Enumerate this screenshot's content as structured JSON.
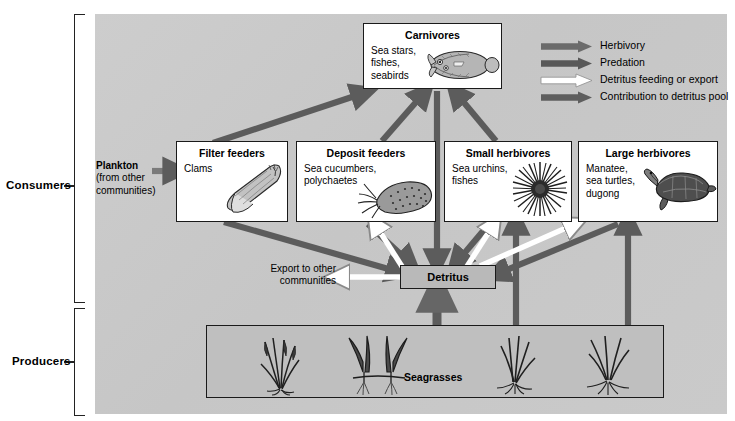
{
  "diagram": {
    "background_color": "#c9c9c9",
    "arrow_dark_color": "#595959",
    "arrow_white_color": "#ffffff"
  },
  "side_labels": [
    {
      "name": "consumers",
      "label": "Consumers"
    },
    {
      "name": "producers",
      "label": "Producers"
    }
  ],
  "legend": {
    "items": [
      {
        "label": "Herbivory",
        "color": "#6b6b6b",
        "style": "solid"
      },
      {
        "label": "Predation",
        "color": "#585858",
        "style": "solid"
      },
      {
        "label": "Detritus feeding or export",
        "color": "#ffffff",
        "style": "outline"
      },
      {
        "label": "Contribution to detritus pool",
        "color": "#5e5e5e",
        "style": "solid"
      }
    ]
  },
  "boxes": {
    "carnivores": {
      "title": "Carnivores",
      "body": "Sea stars,\nfishes,\nseabirds",
      "art": "flatfish"
    },
    "filter_feeders": {
      "title": "Filter feeders",
      "body": "Clams",
      "art": "clam"
    },
    "deposit_feeders": {
      "title": "Deposit feeders",
      "body": "Sea cucumbers,\npolychaetes",
      "art": "sea-cucumber"
    },
    "small_herbivores": {
      "title": "Small herbivores",
      "body": "Sea urchins,\nfishes",
      "art": "sea-urchin"
    },
    "large_herbivores": {
      "title": "Large herbivores",
      "body": "Manatee,\nsea turtles,\ndugong",
      "art": "sea-turtle"
    }
  },
  "detritus": {
    "label": "Detritus"
  },
  "seagrasses": {
    "label": "Seagrasses"
  },
  "plankton": {
    "label_bold": "Plankton",
    "label_rest": "(from other\ncommunities)"
  },
  "export": {
    "label": "Export to other\ncommunities"
  }
}
